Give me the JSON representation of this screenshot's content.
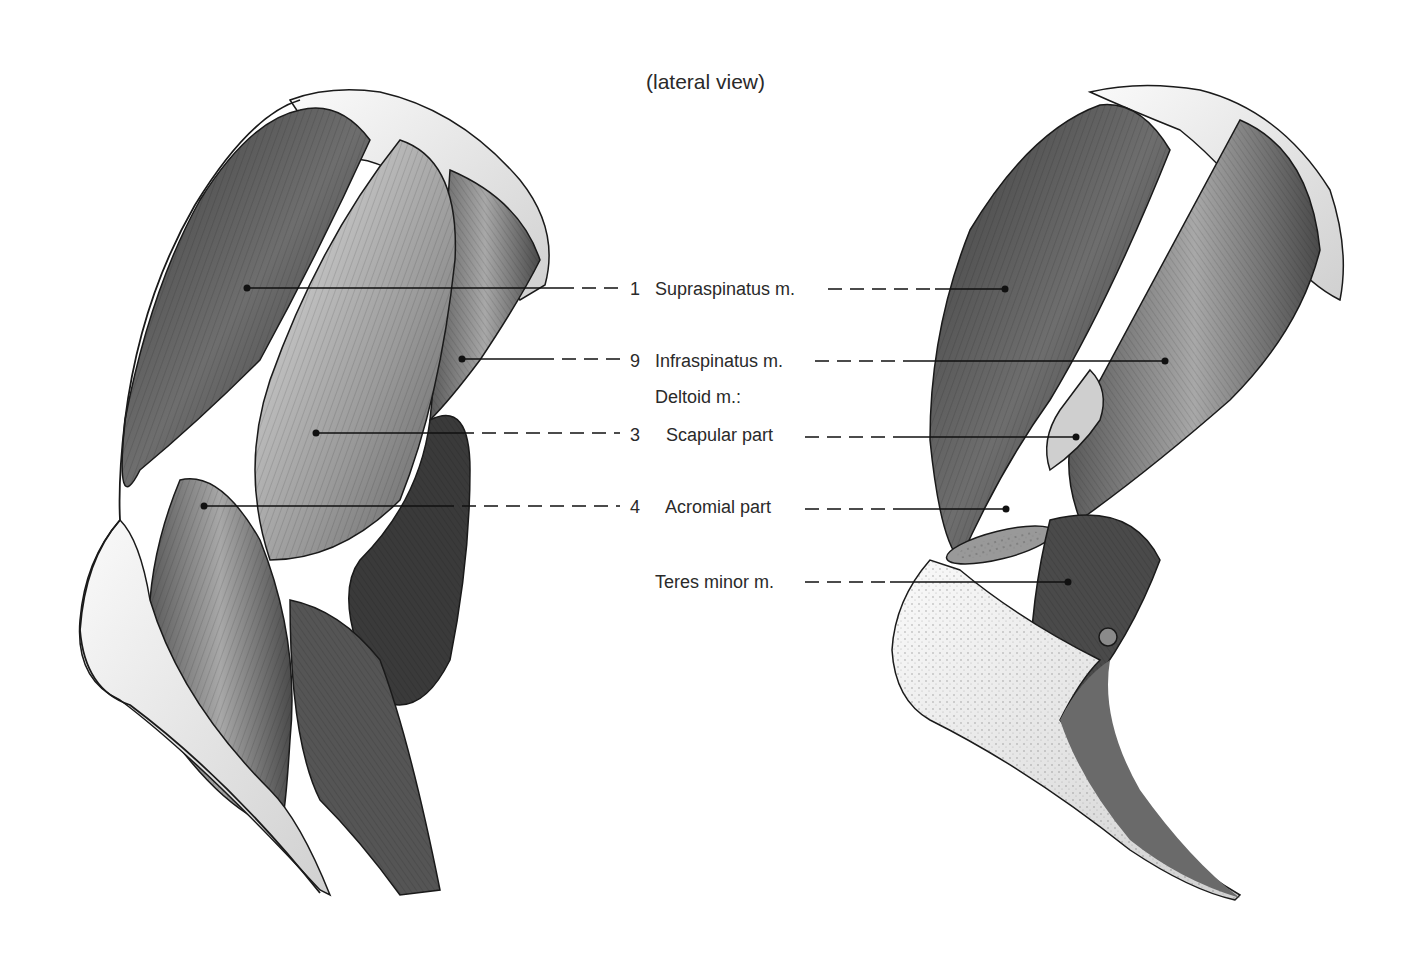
{
  "figure": {
    "title": "(lateral view)",
    "left_illustration": "superficial shoulder musculature (deltoid intact)",
    "right_illustration": "deep shoulder musculature (deltoid reflected)",
    "labels": [
      {
        "number": "1",
        "text": "Supraspinatus m.",
        "y": 289
      },
      {
        "number": "9",
        "text": "Infraspinatus m.",
        "y": 361
      },
      {
        "number": "",
        "text": "Deltoid m.:",
        "y": 397,
        "heading": true
      },
      {
        "number": "3",
        "text": "Scapular part",
        "y": 435
      },
      {
        "number": "4",
        "text": "Acromial part",
        "y": 507
      },
      {
        "number": "",
        "text": "Teres minor m.",
        "y": 582
      }
    ]
  },
  "colors": {
    "background": "#ffffff",
    "ink": "#1a1a1a",
    "muscle_dark": "#4a4a4a",
    "muscle_mid": "#8a8a8a",
    "muscle_light": "#d8d8d8",
    "bone": "#f2f2f2"
  }
}
